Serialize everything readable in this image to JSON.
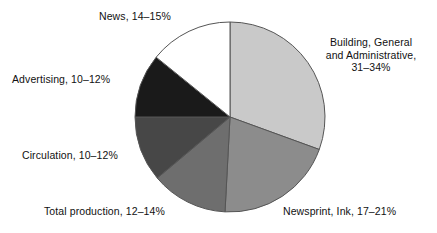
{
  "chart_data": {
    "type": "pie",
    "title": "",
    "subtitle": "",
    "xlabel": "",
    "ylabel": "",
    "legend_position": "none",
    "grid": false,
    "start_angle_deg": 0,
    "direction": "clockwise",
    "center": {
      "x": 230,
      "y": 117
    },
    "radius": 95,
    "categories": [
      "Building, General and Administrative",
      "Newsprint, Ink",
      "Total production",
      "Circulation",
      "Advertising",
      "News"
    ],
    "values": [
      32.5,
      19.0,
      13.0,
      11.0,
      11.0,
      14.5
    ],
    "value_ranges": [
      {
        "low": 31,
        "high": 34
      },
      {
        "low": 17,
        "high": 21
      },
      {
        "low": 12,
        "high": 14
      },
      {
        "low": 10,
        "high": 12
      },
      {
        "low": 10,
        "high": 12
      },
      {
        "low": 14,
        "high": 15
      }
    ],
    "slices": [
      {
        "name": "building",
        "label_line1": "Building, General",
        "label_line2": "and Administrative,",
        "label_line3": "31–34%",
        "range_text": "31–34%",
        "color": "#c9c9c9",
        "start_deg": 0,
        "end_deg": 110
      },
      {
        "name": "newsprint",
        "label": "Newsprint, Ink, 17–21%",
        "range_text": "17–21%",
        "color": "#8c8c8c",
        "start_deg": 110,
        "end_deg": 183
      },
      {
        "name": "total-production",
        "label": "Total production, 12–14%",
        "range_text": "12–14%",
        "color": "#6e6e6e",
        "start_deg": 183,
        "end_deg": 230
      },
      {
        "name": "circulation",
        "label": "Circulation, 10–12%",
        "range_text": "10–12%",
        "color": "#474747",
        "start_deg": 230,
        "end_deg": 270
      },
      {
        "name": "advertising",
        "label": "Advertising, 10–12%",
        "range_text": "10–12%",
        "color": "#1a1a1a",
        "start_deg": 270,
        "end_deg": 309
      },
      {
        "name": "news",
        "label": "News, 14–15%",
        "range_text": "14–15%",
        "color": "#ffffff",
        "start_deg": 309,
        "end_deg": 360
      }
    ],
    "stroke_color": "#555555",
    "background": "#ffffff"
  }
}
